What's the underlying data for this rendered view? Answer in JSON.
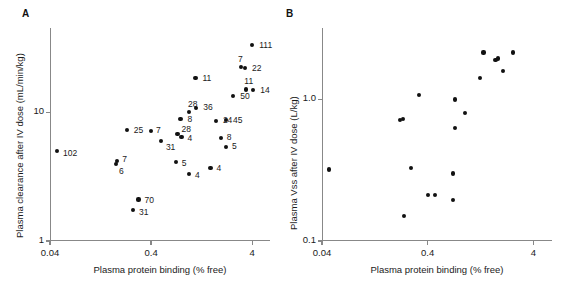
{
  "figure": {
    "background": "#ffffff",
    "marker_color": "#111111",
    "axis_color": "#888888",
    "panels": [
      {
        "id": "A",
        "letter": "A",
        "chart_data": {
          "type": "scatter",
          "title": "",
          "xlabel": "Plasma protein binding (% free)",
          "ylabel": "Plasma clearance after IV dose (mL/min/kg)",
          "xscale": "log",
          "yscale": "log",
          "xlim": [
            0.04,
            6.0
          ],
          "ylim": [
            1,
            45
          ],
          "xticks": [
            0.04,
            0.4,
            4
          ],
          "xticklabels": [
            "0.04",
            "0.4",
            "4"
          ],
          "yticks": [
            1,
            10
          ],
          "yticklabels": [
            "1",
            "10"
          ],
          "grid": false,
          "legend": "none",
          "point_labels_shown": true,
          "points": [
            {
              "label": "111",
              "x": 4.0,
              "y": 33.0,
              "lx": 7,
              "ly": -4
            },
            {
              "label": "7",
              "x": 3.1,
              "y": 22.5,
              "lx": -3,
              "ly": -12
            },
            {
              "label": "22",
              "x": 3.4,
              "y": 22.0,
              "lx": 7,
              "ly": -4
            },
            {
              "label": "11",
              "x": 1.1,
              "y": 18.5,
              "lx": 7,
              "ly": -4
            },
            {
              "label": "11",
              "x": 3.5,
              "y": 15.0,
              "lx": -2,
              "ly": -12
            },
            {
              "label": "14",
              "x": 4.1,
              "y": 14.8,
              "lx": 7,
              "ly": -4
            },
            {
              "label": "50",
              "x": 2.6,
              "y": 13.3,
              "lx": 7,
              "ly": -4
            },
            {
              "label": "28",
              "x": 0.95,
              "y": 10.0,
              "lx": -1,
              "ly": -12
            },
            {
              "label": "36",
              "x": 1.12,
              "y": 10.7,
              "lx": 7,
              "ly": -5
            },
            {
              "label": "8",
              "x": 0.78,
              "y": 8.8,
              "lx": 7,
              "ly": -4
            },
            {
              "label": "24",
              "x": 1.75,
              "y": 8.5,
              "lx": 7,
              "ly": -5
            },
            {
              "label": "45",
              "x": 2.2,
              "y": 8.7,
              "lx": 7,
              "ly": -4
            },
            {
              "label": "25",
              "x": 0.23,
              "y": 7.3,
              "lx": 7,
              "ly": -4
            },
            {
              "label": "7",
              "x": 0.4,
              "y": 7.1,
              "lx": 5,
              "ly": -5
            },
            {
              "label": "28",
              "x": 0.73,
              "y": 6.8,
              "lx": 4,
              "ly": -9
            },
            {
              "label": "4",
              "x": 0.8,
              "y": 6.4,
              "lx": 6,
              "ly": -3
            },
            {
              "label": "31",
              "x": 0.5,
              "y": 6.0,
              "lx": 5,
              "ly": 2
            },
            {
              "label": "8",
              "x": 1.95,
              "y": 6.3,
              "lx": 6,
              "ly": -5
            },
            {
              "label": "5",
              "x": 2.2,
              "y": 5.4,
              "lx": 6,
              "ly": -5
            },
            {
              "label": "102",
              "x": 0.047,
              "y": 5.0,
              "lx": 6,
              "ly": -2
            },
            {
              "label": "7",
              "x": 0.185,
              "y": 4.2,
              "lx": 5,
              "ly": -6
            },
            {
              "label": "6",
              "x": 0.18,
              "y": 3.95,
              "lx": 3,
              "ly": 3
            },
            {
              "label": "5",
              "x": 0.7,
              "y": 4.1,
              "lx": 6,
              "ly": -3
            },
            {
              "label": "4",
              "x": 1.55,
              "y": 3.7,
              "lx": 6,
              "ly": -4
            },
            {
              "label": "4",
              "x": 0.95,
              "y": 3.3,
              "lx": 6,
              "ly": -3
            },
            {
              "label": "70",
              "x": 0.3,
              "y": 2.1,
              "lx": 6,
              "ly": -3
            },
            {
              "label": "31",
              "x": 0.265,
              "y": 1.75,
              "lx": 6,
              "ly": -2
            }
          ]
        }
      },
      {
        "id": "B",
        "letter": "B",
        "chart_data": {
          "type": "scatter",
          "title": "",
          "xlabel": "Plasma protein binding (% free)",
          "ylabel": "Plasma Vss after IV dose (L/kg)",
          "xscale": "log",
          "yscale": "log",
          "xlim": [
            0.04,
            6.0
          ],
          "ylim": [
            0.1,
            3.2
          ],
          "xticks": [
            0.04,
            0.4,
            4
          ],
          "xticklabels": [
            "0.04",
            "0.4",
            "4"
          ],
          "yticks": [
            0.1,
            1.0
          ],
          "yticklabels": [
            "0.1",
            "1.0"
          ],
          "grid": false,
          "legend": "none",
          "point_labels_shown": false,
          "points": [
            {
              "x": 1.35,
              "y": 2.15
            },
            {
              "x": 2.55,
              "y": 2.15
            },
            {
              "x": 1.75,
              "y": 1.9
            },
            {
              "x": 1.85,
              "y": 1.95
            },
            {
              "x": 2.05,
              "y": 1.6
            },
            {
              "x": 1.25,
              "y": 1.42
            },
            {
              "x": 0.33,
              "y": 1.08
            },
            {
              "x": 0.72,
              "y": 1.0
            },
            {
              "x": 0.9,
              "y": 0.8
            },
            {
              "x": 0.22,
              "y": 0.72
            },
            {
              "x": 0.235,
              "y": 0.73
            },
            {
              "x": 0.72,
              "y": 0.63
            },
            {
              "x": 0.28,
              "y": 0.33
            },
            {
              "x": 0.047,
              "y": 0.32
            },
            {
              "x": 0.7,
              "y": 0.3
            },
            {
              "x": 0.4,
              "y": 0.21
            },
            {
              "x": 0.47,
              "y": 0.21
            },
            {
              "x": 0.7,
              "y": 0.195
            },
            {
              "x": 0.24,
              "y": 0.15
            }
          ]
        }
      }
    ]
  }
}
